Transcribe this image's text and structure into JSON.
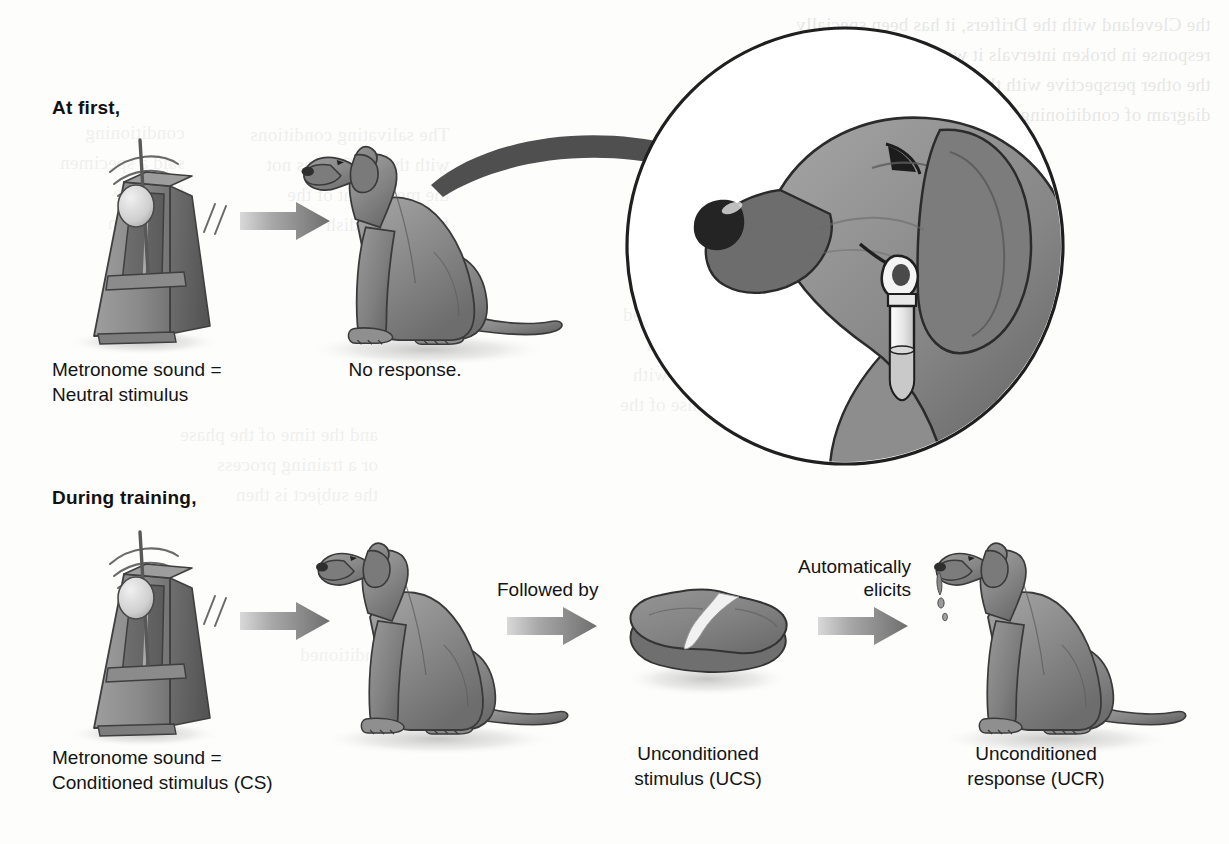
{
  "figure": {
    "kind": "classical-conditioning-diagram",
    "background_color": "#fdfdfc",
    "ink_color": "#141414",
    "fill_mid": "#8e8e8e",
    "fill_dark": "#6f6f6f",
    "fill_light": "#b9b9b9"
  },
  "rows": [
    {
      "id": "row-at-first",
      "heading": "At first,",
      "metronome_caption": "Metronome sound =\nNeutral stimulus",
      "dog_caption": "No response."
    },
    {
      "id": "row-during-training",
      "heading": "During training,",
      "metronome_caption": "Metronome sound =\nConditioned stimulus (CS)",
      "followed_by_label": "Followed by",
      "ucs_caption": "Unconditioned\nstimulus (UCS)",
      "elicits_label": "Automatically\nelicits",
      "ucr_caption": "Unconditioned\nresponse (UCR)"
    }
  ],
  "labels": {
    "at_first": "At first,",
    "during_training": "During training,",
    "metronome_neutral": "Metronome sound =\nNeutral stimulus",
    "no_response": "No response.",
    "metronome_cs": "Metronome sound =\nConditioned stimulus (CS)",
    "followed_by": "Followed by",
    "ucs": "Unconditioned\nstimulus (UCS)",
    "automatically_elicits": "Automatically\nelicits",
    "ucr": "Unconditioned\nresponse (UCR)"
  },
  "bleed_through": {
    "top_right": "the Cleveland with the Drifters, it has been specially\nresponse in broken intervals it was a series\nthe other perspective with the CS with me. Used the\ndiagram of conditioning (UCR) the he saw the",
    "mid_left": "conditioning\nsaid a specimen\nfrom one\nbell when",
    "mid_center": "The salivating conditions\nwith the UCS, does not\nthe mere sight of the\nfood in the dish",
    "lower_left": "and the time of the phase\nor a training process\nthe subject is then",
    "lower_right": "Unconditioned\nconditioned\nstimulus with\nresponse of the",
    "bottom": "conditioned"
  }
}
